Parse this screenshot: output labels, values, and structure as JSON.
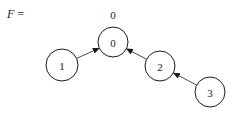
{
  "title": {
    "symbol": "F",
    "equals": "="
  },
  "root_label": "0",
  "nodes": [
    {
      "id": "0",
      "label": "0",
      "cx": 113,
      "cy": 42,
      "r": 15
    },
    {
      "id": "1",
      "label": "1",
      "cx": 62,
      "cy": 65,
      "r": 16
    },
    {
      "id": "2",
      "label": "2",
      "cx": 160,
      "cy": 66,
      "r": 15
    },
    {
      "id": "3",
      "label": "3",
      "cx": 210,
      "cy": 92,
      "r": 15
    }
  ],
  "edges": [
    {
      "from": "1",
      "to": "0"
    },
    {
      "from": "2",
      "to": "0"
    },
    {
      "from": "3",
      "to": "2"
    }
  ]
}
